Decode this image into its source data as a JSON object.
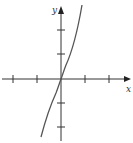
{
  "figure": {
    "type": "function-graph",
    "axes": {
      "x_label": "x",
      "y_label": "y",
      "x_ticks": [
        -2,
        -1,
        1,
        2
      ],
      "y_ticks": [
        -2,
        -1,
        1,
        2
      ]
    },
    "curve": {
      "description": "increasing odd function passing through the origin, steep at the ends (cubic-like)",
      "color": "#555555"
    },
    "colors": {
      "axis": "#333333",
      "curve": "#555555",
      "background": "#ffffff"
    }
  }
}
